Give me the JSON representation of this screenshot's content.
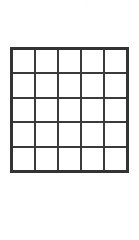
{
  "figure": {
    "kind": "grid",
    "label": "empty-5x5-grid",
    "rows": 5,
    "columns": 5,
    "cell_count": 25,
    "cells": [
      [
        "",
        "",
        "",
        "",
        ""
      ],
      [
        "",
        "",
        "",
        "",
        ""
      ],
      [
        "",
        "",
        "",
        "",
        ""
      ],
      [
        "",
        "",
        "",
        "",
        ""
      ],
      [
        "",
        "",
        "",
        "",
        ""
      ]
    ],
    "geometry": {
      "left": 10,
      "top": 47,
      "width": 119,
      "height": 126
    },
    "style": {
      "page_background": "#ffffff",
      "cell_background": "#ffffff",
      "outer_border_color": "#333333",
      "outer_border_width": 3,
      "inner_line_color": "#3a3a3a",
      "inner_line_width": 2
    }
  }
}
